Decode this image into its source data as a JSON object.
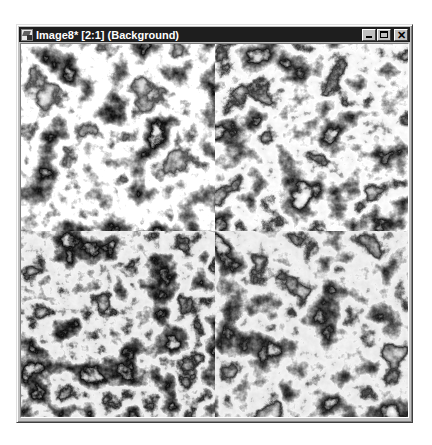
{
  "window": {
    "title": "Image8* [2:1] (Background)",
    "document_name": "Image8*",
    "zoom_level": "2:1",
    "layer": "Background",
    "buttons": {
      "minimize": "minimize",
      "maximize": "maximize",
      "close": "close"
    },
    "icons": {
      "app": "image-document-icon",
      "minimize": "minimize-icon",
      "maximize": "maximize-icon",
      "close": "close-icon"
    },
    "close_glyph": "✕"
  },
  "canvas": {
    "description": "Grayscale cloud / marble texture tiled in a 2x2 grid with visible seams",
    "quadrants": [
      {
        "position": "top-left",
        "seed": 3
      },
      {
        "position": "top-right",
        "seed": 11
      },
      {
        "position": "bottom-left",
        "seed": 23
      },
      {
        "position": "bottom-right",
        "seed": 41
      }
    ],
    "colors": {
      "dark": "#111111",
      "light": "#ffffff"
    }
  },
  "colors": {
    "titlebar": "#1e1e1e",
    "title_text": "#ffffff",
    "chrome": "#c0c0c0",
    "page_background": "#ffffff"
  }
}
